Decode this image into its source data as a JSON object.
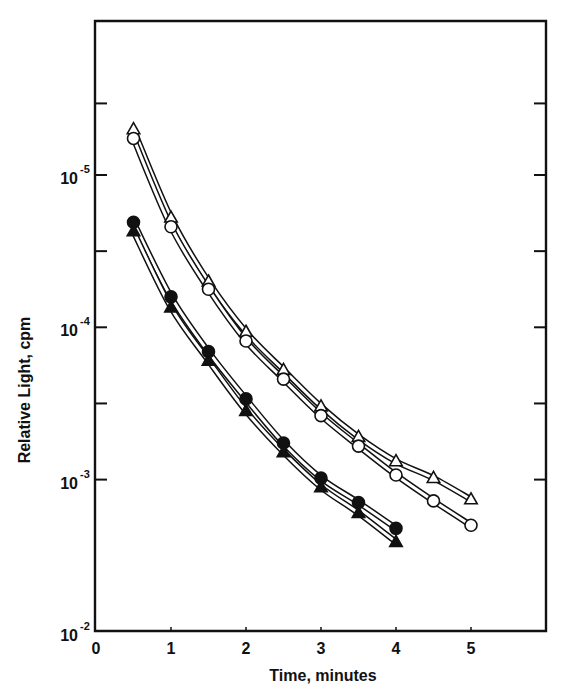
{
  "chart_data": {
    "type": "line",
    "title": "",
    "xlabel": "Time, minutes",
    "ylabel": "Relative Light, cpm",
    "x_ticks": [
      "0",
      "1",
      "2",
      "3",
      "4",
      "5"
    ],
    "x_tick_values": [
      0,
      1,
      2,
      3,
      4,
      5
    ],
    "xlim": [
      0,
      6
    ],
    "y_scale": "log",
    "y_tick_labels": [
      {
        "base": "10",
        "exp": "-5"
      },
      {
        "base": "10",
        "exp": "-4"
      },
      {
        "base": "10",
        "exp": "-3"
      },
      {
        "base": "10",
        "exp": "-2"
      }
    ],
    "y_tick_exponents": [
      -5,
      -4,
      -3,
      -2
    ],
    "y_minor_tick_exponents": [
      -5.47,
      -4.5,
      -3.5
    ],
    "ylim_exponent": [
      -5.5,
      -2
    ],
    "y_axis_note": "Axis printed with 10^-5 at top increasing to 10^-2 at bottom; values below are the exponent position on the printed scale.",
    "grid": false,
    "legend": null,
    "series": [
      {
        "name": "open-triangle",
        "marker": "triangle",
        "filled": false,
        "x": [
          0.5,
          1,
          1.5,
          2,
          2.5,
          3,
          3.5,
          4,
          4.5,
          5
        ],
        "y_exponent": [
          -5.3,
          -4.72,
          -4.3,
          -3.97,
          -3.72,
          -3.48,
          -3.28,
          -3.12,
          -3.01,
          -2.87
        ]
      },
      {
        "name": "open-circle",
        "marker": "circle",
        "filled": false,
        "x": [
          0.5,
          1,
          1.5,
          2,
          2.5,
          3,
          3.5,
          4,
          4.5,
          5
        ],
        "y_exponent": [
          -5.24,
          -4.66,
          -4.25,
          -3.91,
          -3.66,
          -3.42,
          -3.22,
          -3.03,
          -2.86,
          -2.7
        ]
      },
      {
        "name": "filled-circle",
        "marker": "circle",
        "filled": true,
        "x": [
          0.5,
          1,
          1.5,
          2,
          2.5,
          3,
          3.5,
          4
        ],
        "y_exponent": [
          -4.69,
          -4.2,
          -3.84,
          -3.53,
          -3.24,
          -3.01,
          -2.85,
          -2.68
        ]
      },
      {
        "name": "filled-triangle",
        "marker": "triangle",
        "filled": true,
        "x": [
          0.5,
          1,
          1.5,
          2,
          2.5,
          3,
          3.5,
          4
        ],
        "y_exponent": [
          -4.63,
          -4.13,
          -3.78,
          -3.45,
          -3.18,
          -2.95,
          -2.78,
          -2.59
        ]
      }
    ]
  },
  "labels": {
    "xlabel": "Time, minutes",
    "ylabel": "Relative Light, cpm"
  }
}
